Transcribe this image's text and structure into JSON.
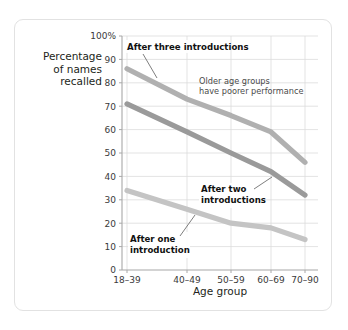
{
  "chart_data": {
    "type": "line",
    "title": "",
    "xlabel": "Age group",
    "ylabel": "Percentage of names recalled",
    "categories": [
      "18–39",
      "40–49",
      "50–59",
      "60–69",
      "70–90"
    ],
    "ylim": [
      0,
      100
    ],
    "ytick_labels": [
      "0",
      "10",
      "20",
      "30",
      "40",
      "50",
      "60",
      "70",
      "80",
      "90",
      "100%"
    ],
    "ytick_values": [
      0,
      10,
      20,
      30,
      40,
      50,
      60,
      70,
      80,
      90,
      100
    ],
    "grid": "both",
    "legend": "inline-annotations",
    "series": [
      {
        "name": "After three introductions",
        "values": [
          86,
          73,
          66,
          59,
          46
        ],
        "color": "#b0b0b0"
      },
      {
        "name": "After two introductions",
        "values": [
          71,
          59,
          50,
          42,
          32
        ],
        "color": "#9a9a9a"
      },
      {
        "name": "After one introduction",
        "values": [
          34,
          26,
          20,
          18,
          13
        ],
        "color": "#c4c4c4"
      }
    ],
    "annotations": [
      {
        "text": "Older age groups",
        "text2": "have poorer performance"
      }
    ]
  },
  "axes": {
    "y_axis_label_line1": "Percentage",
    "y_axis_label_line2": "of names",
    "y_axis_label_line3": "recalled",
    "x_axis_title": "Age group"
  },
  "labels": {
    "series_three": "After three introductions",
    "series_two_line1": "After two",
    "series_two_line2": "introductions",
    "series_one_line1": "After one",
    "series_one_line2": "introduction",
    "note_line1": "Older age groups",
    "note_line2": "have poorer performance"
  },
  "ticks": {
    "y": [
      "100%",
      "90",
      "80",
      "70",
      "60",
      "50",
      "40",
      "30",
      "20",
      "10",
      "0"
    ],
    "x": [
      "18–39",
      "40–49",
      "50–59",
      "60–69",
      "70–90"
    ]
  },
  "colors": {
    "line_three": "#b0b0b0",
    "line_two": "#9a9a9a",
    "line_one": "#c6c6c6",
    "grid": "#dcdcdc",
    "axis": "#a8a8a8",
    "frame": "#e2e2e2",
    "text": "#231f20"
  }
}
